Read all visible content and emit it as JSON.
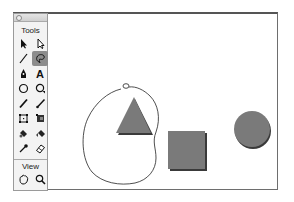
{
  "toolbar": {
    "title": "Tools",
    "view_title": "View",
    "tools": [
      {
        "name": "selection-tool",
        "icon": "arrow-icon"
      },
      {
        "name": "subselection-tool",
        "icon": "hollow-arrow-icon"
      },
      {
        "name": "line-tool",
        "icon": "line-icon"
      },
      {
        "name": "lasso-tool",
        "icon": "lasso-icon",
        "selected": true
      },
      {
        "name": "pen-tool",
        "icon": "pen-icon"
      },
      {
        "name": "text-tool",
        "icon": "text-icon",
        "glyph": "A"
      },
      {
        "name": "oval-tool",
        "icon": "oval-icon"
      },
      {
        "name": "polystar-tool",
        "icon": "polystar-icon"
      },
      {
        "name": "pencil-tool",
        "icon": "pencil-icon"
      },
      {
        "name": "brush-tool",
        "icon": "brush-icon"
      },
      {
        "name": "free-transform-tool",
        "icon": "free-transform-icon"
      },
      {
        "name": "gradient-transform-tool",
        "icon": "gradient-transform-icon"
      },
      {
        "name": "ink-bottle-tool",
        "icon": "ink-bottle-icon"
      },
      {
        "name": "paint-bucket-tool",
        "icon": "paint-bucket-icon"
      },
      {
        "name": "eyedropper-tool",
        "icon": "eyedropper-icon"
      },
      {
        "name": "eraser-tool",
        "icon": "eraser-icon"
      }
    ],
    "view_tools": [
      {
        "name": "hand-tool",
        "icon": "hand-icon"
      },
      {
        "name": "zoom-tool",
        "icon": "magnifier-icon"
      }
    ]
  },
  "stage": {
    "shapes": [
      {
        "type": "triangle",
        "fill": "#7a7a7a"
      },
      {
        "type": "square",
        "fill": "#7a7a7a"
      },
      {
        "type": "circle",
        "fill": "#7a7a7a"
      }
    ],
    "lasso_path": "freehand selection outline"
  },
  "colors": {
    "shape_fill": "#7a7a7a",
    "shape_shadow": "#3a3a3a",
    "selected_tool_bg": "#8c8c8c"
  }
}
